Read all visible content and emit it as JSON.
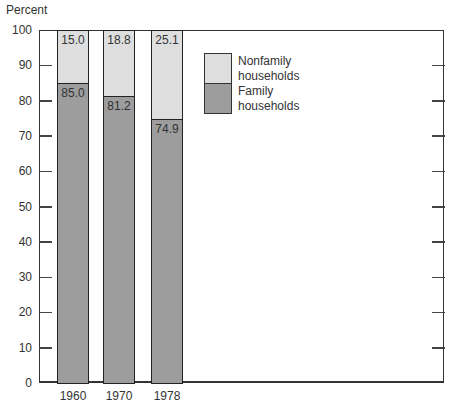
{
  "chart_data": {
    "type": "bar",
    "stacked": true,
    "title": "",
    "ylabel": "Percent",
    "xlabel": "",
    "ylim": [
      0,
      100
    ],
    "yticks": [
      0,
      10,
      20,
      30,
      40,
      50,
      60,
      70,
      80,
      90,
      100
    ],
    "categories": [
      "1960",
      "1970",
      "1978"
    ],
    "series": [
      {
        "name": "Family households",
        "color": "#9d9d9d",
        "values": [
          85.0,
          81.2,
          74.9
        ],
        "labels": [
          "85.0",
          "81.2",
          "74.9"
        ]
      },
      {
        "name": "Nonfamily households",
        "color": "#dedede",
        "values": [
          15.0,
          18.8,
          25.1
        ],
        "labels": [
          "15.0",
          "18.8",
          "25.1"
        ]
      }
    ],
    "legend": {
      "position": "upper-center-right",
      "entries": [
        {
          "line1": "Nonfamily",
          "line2": "households"
        },
        {
          "line1": "Family",
          "line2": "households"
        }
      ]
    },
    "grid": false
  }
}
